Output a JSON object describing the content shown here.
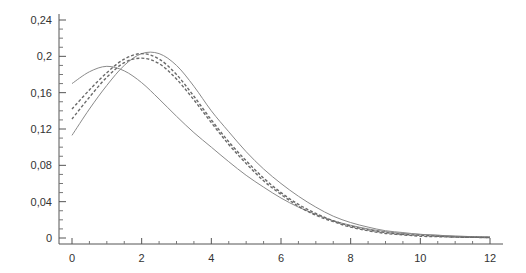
{
  "chart_data": {
    "type": "line",
    "title": "",
    "xlabel": "",
    "ylabel": "",
    "xlim": [
      0,
      12
    ],
    "ylim": [
      0,
      0.24
    ],
    "grid": false,
    "legend": null,
    "x_ticks": [
      0,
      2,
      4,
      6,
      8,
      10,
      12
    ],
    "x_tick_labels": [
      "0",
      "2",
      "4",
      "6",
      "8",
      "10",
      "12"
    ],
    "y_ticks": [
      0,
      0.04,
      0.08,
      0.12,
      0.16,
      0.2,
      0.24
    ],
    "y_tick_labels": [
      "0",
      "0,04",
      "0,08",
      "0,12",
      "0,16",
      "0,2",
      "0,24"
    ],
    "x": [
      0,
      0.5,
      1,
      1.5,
      2,
      2.5,
      3,
      3.5,
      4,
      4.5,
      5,
      5.5,
      6,
      6.5,
      7,
      7.5,
      8,
      8.5,
      9,
      9.5,
      10,
      10.5,
      11,
      11.5,
      12
    ],
    "series": [
      {
        "name": "solid-1",
        "style": "solid",
        "color": "#8a8a8a",
        "values": [
          0.17,
          0.183,
          0.189,
          0.184,
          0.171,
          0.153,
          0.134,
          0.116,
          0.1,
          0.084,
          0.069,
          0.056,
          0.044,
          0.034,
          0.026,
          0.019,
          0.014,
          0.01,
          0.007,
          0.005,
          0.004,
          0.003,
          0.002,
          0.0015,
          0.001
        ]
      },
      {
        "name": "solid-2",
        "style": "solid",
        "color": "#8a8a8a",
        "values": [
          0.113,
          0.142,
          0.168,
          0.19,
          0.203,
          0.203,
          0.19,
          0.167,
          0.14,
          0.117,
          0.095,
          0.076,
          0.06,
          0.046,
          0.034,
          0.024,
          0.017,
          0.012,
          0.008,
          0.006,
          0.004,
          0.003,
          0.002,
          0.0015,
          0.001
        ]
      },
      {
        "name": "dashed-1",
        "style": "dashed",
        "color": "#6a6a6a",
        "values": [
          0.142,
          0.163,
          0.182,
          0.197,
          0.203,
          0.197,
          0.18,
          0.156,
          0.13,
          0.106,
          0.085,
          0.066,
          0.05,
          0.037,
          0.027,
          0.019,
          0.013,
          0.009,
          0.006,
          0.004,
          0.003,
          0.002,
          0.001,
          0.0008,
          0.0005
        ]
      },
      {
        "name": "dashed-2",
        "style": "dashed",
        "color": "#6a6a6a",
        "values": [
          0.131,
          0.155,
          0.177,
          0.193,
          0.198,
          0.192,
          0.175,
          0.152,
          0.127,
          0.103,
          0.082,
          0.063,
          0.048,
          0.035,
          0.025,
          0.018,
          0.012,
          0.008,
          0.005,
          0.0035,
          0.002,
          0.0015,
          0.001,
          0.0007,
          0.0005
        ]
      }
    ]
  }
}
